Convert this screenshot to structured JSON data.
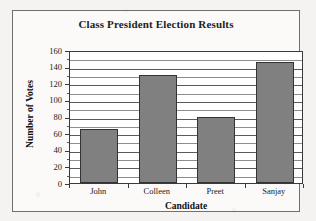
{
  "chart_data": {
    "type": "bar",
    "title": "Class President Election Results",
    "xlabel": "Candidate",
    "ylabel": "Number of Votes",
    "categories": [
      "John",
      "Colleen",
      "Preet",
      "Sanjay"
    ],
    "values": [
      65,
      130,
      80,
      145
    ],
    "ylim": [
      0,
      160
    ],
    "ytick_labels": [
      "0",
      "20",
      "40",
      "60",
      "80",
      "100",
      "120",
      "140",
      "160"
    ],
    "ytick_values": [
      0,
      20,
      40,
      60,
      80,
      100,
      120,
      140,
      160
    ],
    "minor_tick_step": 10,
    "grid": true,
    "legend": null,
    "bar_color": "#808080",
    "bar_border_color": "#333333",
    "axis_color": "#3a3a3a",
    "background_color": "#f4f3f1",
    "plot_background_color": "#ffffff"
  }
}
